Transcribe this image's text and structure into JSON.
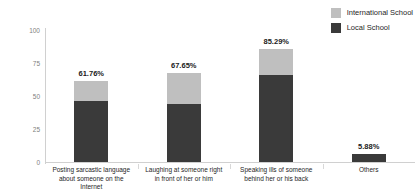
{
  "chart_data": {
    "type": "bar",
    "subtype": "stacked-bar",
    "title": "",
    "xlabel": "",
    "ylabel": "",
    "ylim": [
      0,
      100
    ],
    "yticks": [
      "0",
      "25",
      "50",
      "75",
      "100"
    ],
    "grid": false,
    "legend_position": "top-right",
    "categories": [
      "Posting sarcastic language about someone on the Internet",
      "Laughing at someone right in front of her or him",
      "Speaking ills of someone behind her or his back",
      "Others"
    ],
    "category_lines": [
      [
        "Posting sarcastic language",
        "about someone on the",
        "Internet"
      ],
      [
        "Laughing at someone right",
        "in front of her or him"
      ],
      [
        "Speaking ills of someone",
        "behind her or his back"
      ],
      [
        "Others"
      ]
    ],
    "series": [
      {
        "name": "Local School",
        "color": "#3a3a3a",
        "values": [
          45.88,
          43.65,
          66.29,
          5.88
        ]
      },
      {
        "name": "International School",
        "color": "#bfbfbf",
        "values": [
          15.88,
          24.0,
          19.0,
          0
        ]
      }
    ],
    "totals": [
      61.76,
      67.65,
      85.29,
      5.88
    ],
    "total_labels": [
      "61.76%",
      "67.65%",
      "85.29%",
      "5.88%"
    ]
  },
  "legend": {
    "items": [
      {
        "label": "International School",
        "color": "#bfbfbf"
      },
      {
        "label": "Local School",
        "color": "#3a3a3a"
      }
    ]
  }
}
